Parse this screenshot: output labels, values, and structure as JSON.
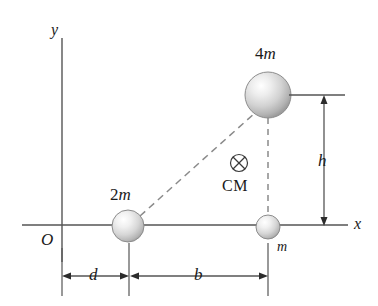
{
  "figure": {
    "type": "physics-diagram",
    "colors": {
      "line": "#4d4d4d",
      "text": "#1a1a1a",
      "dashed": "#777777",
      "sphere_light": "#fdfdfd",
      "sphere_mid": "#c9c9c9",
      "sphere_dark": "#9a9a9a",
      "sphere_outline": "#8a8a8a",
      "background": "#ffffff"
    }
  },
  "axes": {
    "x_label": "x",
    "y_label": "y",
    "origin_label": "O"
  },
  "masses": [
    {
      "id": "mass-2m",
      "label_number": "2",
      "label_variable": "m",
      "label_full": "2 m",
      "x": 128,
      "y": 226,
      "radius": 16
    },
    {
      "id": "mass-4m",
      "label_number": "4",
      "label_variable": "m",
      "label_full": "4 m",
      "x": 268,
      "y": 95,
      "radius": 23
    },
    {
      "id": "mass-m",
      "label_number": "",
      "label_variable": "m",
      "label_full": "m",
      "x": 268,
      "y": 227,
      "radius": 12
    }
  ],
  "center_of_mass": {
    "marker": "circle-x-icon",
    "label": "CM",
    "x": 239,
    "y": 163
  },
  "dimensions": [
    {
      "id": "dim-d",
      "label": "d",
      "orientation": "horizontal",
      "from": 62,
      "to": 128,
      "at": 276
    },
    {
      "id": "dim-b",
      "label": "b",
      "orientation": "horizontal",
      "from": 130,
      "to": 268,
      "at": 276
    },
    {
      "id": "dim-h",
      "label": "h",
      "orientation": "vertical",
      "from": 95,
      "to": 225,
      "at": 324
    }
  ],
  "connectors": [
    {
      "id": "diagonal-2m-to-4m",
      "style": "dashed",
      "from_mass": "mass-2m",
      "to_mass": "mass-4m"
    },
    {
      "id": "vertical-4m-to-m",
      "style": "dashed",
      "from_mass": "mass-4m",
      "to_mass": "mass-m"
    }
  ]
}
